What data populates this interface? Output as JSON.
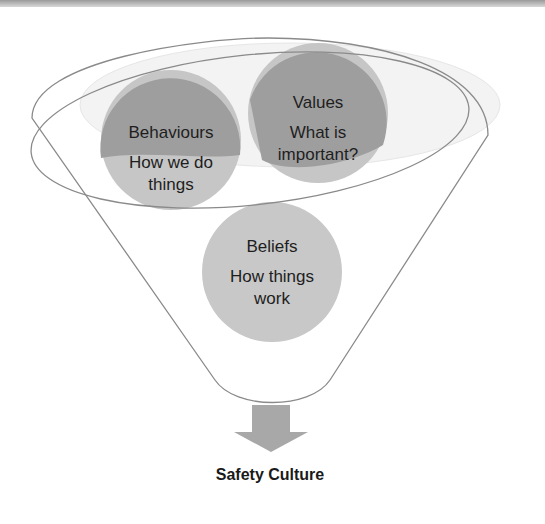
{
  "diagram": {
    "type": "funnel",
    "circles": [
      {
        "title": "Behaviours",
        "subtitle": "How we do things",
        "subtitle_lines": [
          "How we do",
          "things"
        ]
      },
      {
        "title": "Values",
        "subtitle": "What is important?",
        "subtitle_lines": [
          "What is",
          "important?"
        ]
      },
      {
        "title": "Beliefs",
        "subtitle": "How things work",
        "subtitle_lines": [
          "How things",
          "work"
        ]
      }
    ],
    "output_label": "Safety Culture",
    "colors": {
      "circle_dark": "#9c9c9c",
      "circle_light": "#c4c4c4",
      "outline": "#8a8a8a",
      "arrow": "#a8a8a8"
    }
  }
}
